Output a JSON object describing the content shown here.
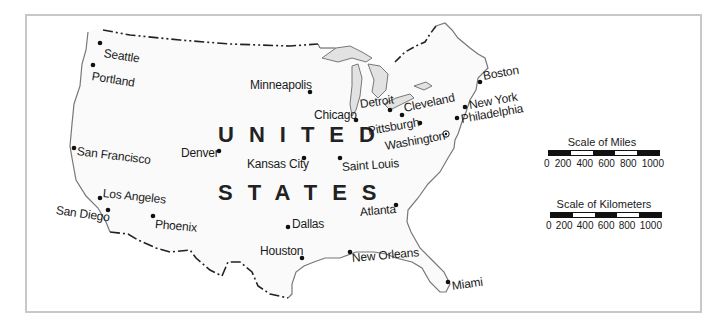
{
  "map": {
    "country_label_line1": "UNITED",
    "country_label_line2": "STATES",
    "cities": [
      {
        "name": "Seattle"
      },
      {
        "name": "Portland"
      },
      {
        "name": "San Francisco"
      },
      {
        "name": "Los Angeles"
      },
      {
        "name": "San Diego"
      },
      {
        "name": "Phoenix"
      },
      {
        "name": "Denver"
      },
      {
        "name": "Minneapolis"
      },
      {
        "name": "Chicago"
      },
      {
        "name": "Detroit"
      },
      {
        "name": "Cleveland"
      },
      {
        "name": "Pittsburgh"
      },
      {
        "name": "Washington"
      },
      {
        "name": "Boston"
      },
      {
        "name": "New York"
      },
      {
        "name": "Philadelphia"
      },
      {
        "name": "Kansas City"
      },
      {
        "name": "Saint Louis"
      },
      {
        "name": "Dallas"
      },
      {
        "name": "Houston"
      },
      {
        "name": "New Orleans"
      },
      {
        "name": "Atlanta"
      },
      {
        "name": "Miami"
      }
    ]
  },
  "legend": {
    "miles": {
      "title": "Scale of Miles",
      "ticks": [
        "0",
        "200",
        "400",
        "600",
        "800",
        "1000"
      ]
    },
    "kilometers": {
      "title": "Scale of Kilometers",
      "ticks": [
        "0",
        "200",
        "400",
        "600",
        "800",
        "1000"
      ]
    }
  }
}
